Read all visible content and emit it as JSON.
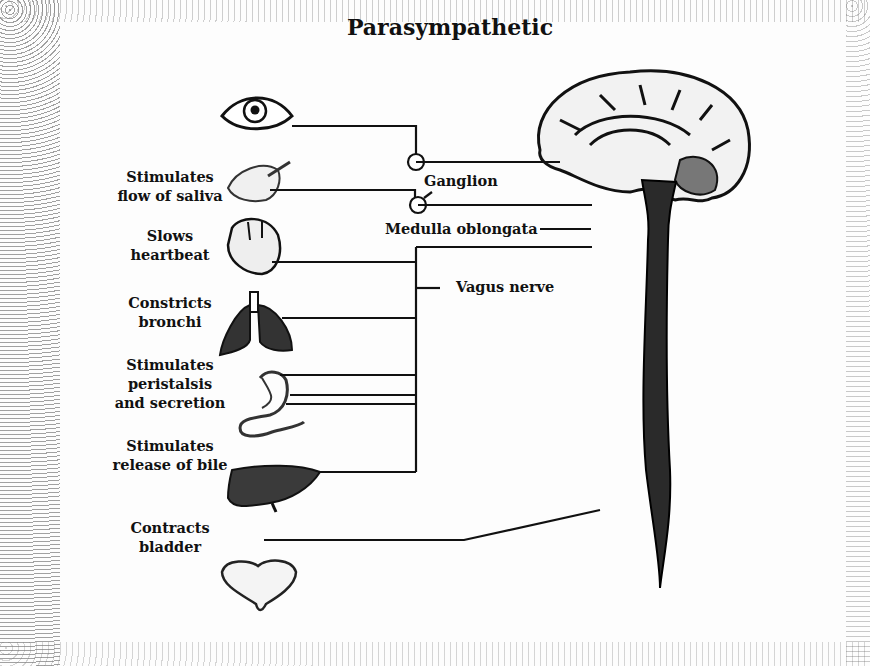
{
  "title": "Parasympathetic",
  "effects": [
    {
      "organ": "eye",
      "label": ""
    },
    {
      "organ": "salivary-gland",
      "label_line1": "Stimulates",
      "label_line2": "flow of saliva"
    },
    {
      "organ": "heart",
      "label_line1": "Slows",
      "label_line2": "heartbeat"
    },
    {
      "organ": "lungs",
      "label_line1": "Constricts",
      "label_line2": "bronchi"
    },
    {
      "organ": "stomach-pancreas",
      "label_line1": "Stimulates",
      "label_line2": "peristalsis",
      "label_line3": "and secretion"
    },
    {
      "organ": "liver",
      "label_line1": "Stimulates",
      "label_line2": "release of bile"
    },
    {
      "organ": "bladder",
      "label_line1": "Contracts",
      "label_line2": "bladder"
    }
  ],
  "callouts": {
    "ganglion": "Ganglion",
    "medulla": "Medulla oblongata",
    "vagus": "Vagus nerve"
  }
}
